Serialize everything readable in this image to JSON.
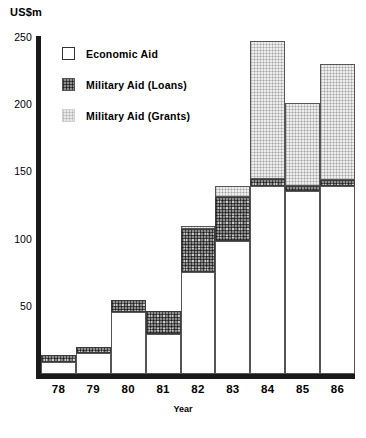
{
  "chart_data": {
    "type": "bar",
    "subtype": "stacked-vertical",
    "title": "",
    "xlabel": "Year",
    "ylabel": "US$m",
    "ylim": [
      0,
      250
    ],
    "yticks": [
      0,
      50,
      100,
      150,
      200,
      250
    ],
    "ytick_labels": [
      "",
      "50",
      "100",
      "150",
      "200",
      "250"
    ],
    "grid": false,
    "legend_position": "inside-upper-left",
    "categories": [
      "78",
      "79",
      "80",
      "81",
      "82",
      "83",
      "84",
      "85",
      "86"
    ],
    "series": [
      {
        "name": "Economic Aid",
        "key": "economic",
        "values": [
          9,
          16,
          46,
          30,
          76,
          99,
          140,
          136,
          140
        ]
      },
      {
        "name": "Military Aid (Loans)",
        "key": "loans",
        "values": [
          5,
          4,
          9,
          17,
          32,
          33,
          5,
          4,
          4
        ]
      },
      {
        "name": "Military Aid (Grants)",
        "key": "grants",
        "values": [
          0,
          0,
          0,
          0,
          2,
          8,
          103,
          62,
          87
        ]
      }
    ],
    "totals": [
      14,
      20,
      55,
      47,
      110,
      140,
      248,
      202,
      231
    ]
  },
  "axes": {
    "y_unit_label": "US$m",
    "x_title": "Year"
  },
  "legend": {
    "items": [
      {
        "label": "Economic  Aid",
        "swatch": "economic-swatch"
      },
      {
        "label": "Military  Aid (Loans)",
        "swatch": "loans-swatch"
      },
      {
        "label": "Military  Aid (Grants)",
        "swatch": "grants-swatch"
      }
    ]
  },
  "colors": {
    "axis": "#1a1a1a",
    "economic": "#ffffff",
    "loans": "#8e8e8e",
    "grants": "#eeeeee",
    "outline": "#555555",
    "text": "#000000"
  }
}
